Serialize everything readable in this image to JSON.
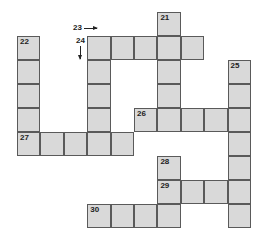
{
  "puzzle": {
    "title": "Crossword grid",
    "colors": {
      "cell_fill": "#d9d9d9",
      "cell_border": "#5a5a5a",
      "text": "#222222",
      "background": "#ffffff"
    },
    "outside_labels": [
      {
        "text": "23",
        "direction": "across",
        "arrow": "right"
      },
      {
        "text": "24",
        "direction": "down",
        "arrow": "down"
      }
    ],
    "cells": [
      {
        "row": 0,
        "col": 6,
        "number": "21"
      },
      {
        "row": 1,
        "col": 0,
        "number": "22"
      },
      {
        "row": 1,
        "col": 3,
        "number": ""
      },
      {
        "row": 1,
        "col": 4,
        "number": ""
      },
      {
        "row": 1,
        "col": 5,
        "number": ""
      },
      {
        "row": 1,
        "col": 6,
        "number": ""
      },
      {
        "row": 1,
        "col": 7,
        "number": ""
      },
      {
        "row": 2,
        "col": 0,
        "number": ""
      },
      {
        "row": 2,
        "col": 3,
        "number": ""
      },
      {
        "row": 2,
        "col": 6,
        "number": ""
      },
      {
        "row": 2,
        "col": 9,
        "number": "25"
      },
      {
        "row": 3,
        "col": 0,
        "number": ""
      },
      {
        "row": 3,
        "col": 3,
        "number": ""
      },
      {
        "row": 3,
        "col": 6,
        "number": ""
      },
      {
        "row": 3,
        "col": 9,
        "number": ""
      },
      {
        "row": 4,
        "col": 0,
        "number": ""
      },
      {
        "row": 4,
        "col": 3,
        "number": ""
      },
      {
        "row": 4,
        "col": 5,
        "number": "26"
      },
      {
        "row": 4,
        "col": 6,
        "number": ""
      },
      {
        "row": 4,
        "col": 7,
        "number": ""
      },
      {
        "row": 4,
        "col": 8,
        "number": ""
      },
      {
        "row": 4,
        "col": 9,
        "number": ""
      },
      {
        "row": 5,
        "col": 0,
        "number": "27"
      },
      {
        "row": 5,
        "col": 1,
        "number": ""
      },
      {
        "row": 5,
        "col": 2,
        "number": ""
      },
      {
        "row": 5,
        "col": 3,
        "number": ""
      },
      {
        "row": 5,
        "col": 4,
        "number": ""
      },
      {
        "row": 5,
        "col": 9,
        "number": ""
      },
      {
        "row": 6,
        "col": 6,
        "number": "28"
      },
      {
        "row": 6,
        "col": 9,
        "number": ""
      },
      {
        "row": 7,
        "col": 6,
        "number": "29"
      },
      {
        "row": 7,
        "col": 7,
        "number": ""
      },
      {
        "row": 7,
        "col": 8,
        "number": ""
      },
      {
        "row": 7,
        "col": 9,
        "number": ""
      },
      {
        "row": 8,
        "col": 3,
        "number": "30"
      },
      {
        "row": 8,
        "col": 4,
        "number": ""
      },
      {
        "row": 8,
        "col": 5,
        "number": ""
      },
      {
        "row": 8,
        "col": 6,
        "number": ""
      },
      {
        "row": 8,
        "col": 9,
        "number": ""
      }
    ],
    "entries": {
      "across": [
        "23",
        "26",
        "27",
        "29",
        "30"
      ],
      "down": [
        "21",
        "22",
        "24",
        "25",
        "28"
      ]
    }
  }
}
